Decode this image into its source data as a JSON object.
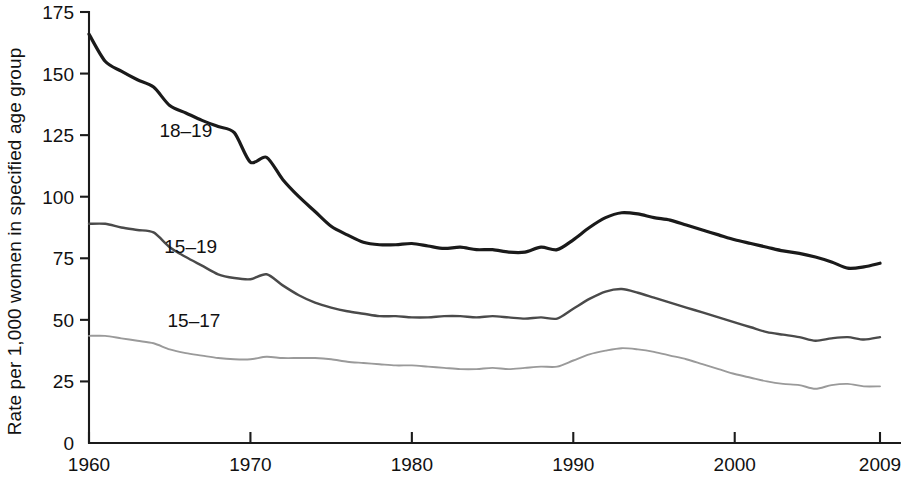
{
  "chart_data": {
    "type": "line",
    "title": "",
    "xlabel": "",
    "ylabel": "Rate per 1,000 women in specified age group",
    "xlim": [
      1960,
      2009
    ],
    "ylim": [
      0,
      175
    ],
    "grid": false,
    "legend_position": "inline-labels",
    "y_ticks": [
      0,
      25,
      50,
      75,
      100,
      125,
      150,
      175
    ],
    "y_tick_labels": [
      "0",
      "25",
      "50",
      "75",
      "100",
      "125",
      "150",
      "175"
    ],
    "x_ticks": [
      1960,
      1970,
      1980,
      1990,
      2000,
      2009
    ],
    "x_tick_labels": [
      "1960",
      "1970",
      "1980",
      "1990",
      "2000",
      "2009"
    ],
    "x": [
      1960,
      1961,
      1962,
      1963,
      1964,
      1965,
      1966,
      1967,
      1968,
      1969,
      1970,
      1971,
      1972,
      1973,
      1974,
      1975,
      1976,
      1977,
      1978,
      1979,
      1980,
      1981,
      1982,
      1983,
      1984,
      1985,
      1986,
      1987,
      1988,
      1989,
      1990,
      1991,
      1992,
      1993,
      1994,
      1995,
      1996,
      1997,
      1998,
      1999,
      2000,
      2001,
      2002,
      2003,
      2004,
      2005,
      2006,
      2007,
      2008,
      2009
    ],
    "series": [
      {
        "name": "18-19",
        "label": "18–19",
        "color": "#1a1a1a",
        "width": 3.2,
        "label_x": 1966.0,
        "label_y": 127,
        "values": [
          166.0,
          155.0,
          151.0,
          147.5,
          144.5,
          137.0,
          134.0,
          131.0,
          128.5,
          126.0,
          114.0,
          116.0,
          107.0,
          100.0,
          94.0,
          88.0,
          84.5,
          81.5,
          80.5,
          80.5,
          81.0,
          80.0,
          79.0,
          79.5,
          78.5,
          78.5,
          77.5,
          77.5,
          79.5,
          78.5,
          82.5,
          87.5,
          91.5,
          93.5,
          93.0,
          91.5,
          90.5,
          88.5,
          86.5,
          84.5,
          82.5,
          81.0,
          79.5,
          78.0,
          77.0,
          75.5,
          73.5,
          71.0,
          71.5,
          73.0
        ]
      },
      {
        "name": "15-19",
        "label": "15–19",
        "color": "#4a4a4a",
        "width": 2.4,
        "label_x": 1966.3,
        "label_y": 80,
        "values": [
          89.0,
          89.0,
          87.5,
          86.5,
          85.5,
          79.5,
          75.5,
          72.0,
          68.5,
          67.0,
          66.5,
          68.5,
          64.0,
          60.0,
          57.0,
          55.0,
          53.5,
          52.5,
          51.5,
          51.5,
          51.0,
          51.0,
          51.5,
          51.5,
          51.0,
          51.5,
          51.0,
          50.5,
          51.0,
          50.5,
          54.5,
          58.5,
          61.5,
          62.5,
          61.0,
          59.0,
          57.0,
          55.0,
          53.0,
          51.0,
          49.0,
          47.0,
          45.0,
          44.0,
          43.0,
          41.5,
          42.5,
          43.0,
          42.0,
          43.0
        ]
      },
      {
        "name": "15-17",
        "label": "15–17",
        "color": "#9a9a9a",
        "width": 1.9,
        "label_x": 1966.5,
        "label_y": 50,
        "values": [
          43.5,
          43.5,
          42.5,
          41.5,
          40.5,
          38.0,
          36.5,
          35.5,
          34.5,
          34.0,
          34.0,
          35.0,
          34.5,
          34.5,
          34.5,
          34.0,
          33.0,
          32.5,
          32.0,
          31.5,
          31.5,
          31.0,
          30.5,
          30.0,
          30.0,
          30.5,
          30.0,
          30.5,
          31.0,
          31.0,
          33.5,
          36.0,
          37.5,
          38.5,
          38.0,
          37.0,
          35.5,
          34.0,
          32.0,
          30.0,
          28.0,
          26.5,
          25.0,
          24.0,
          23.5,
          22.0,
          23.5,
          24.0,
          23.0,
          23.0
        ]
      }
    ]
  },
  "axis": {
    "origin_label": "0"
  }
}
